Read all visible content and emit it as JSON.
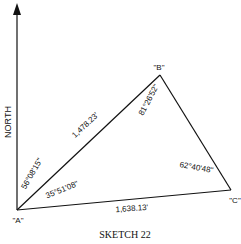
{
  "diagram": {
    "caption": "SKETCH 22",
    "north_label": "NORTH",
    "points": {
      "A": {
        "label": "\"A\"",
        "x": 17,
        "y": 210
      },
      "B": {
        "label": "\"B\"",
        "x": 160,
        "y": 75
      },
      "C": {
        "label": "\"C\"",
        "x": 231,
        "y": 190
      }
    },
    "distances": {
      "AB": "1,478.23'",
      "AC": "1,638.13'"
    },
    "angles": {
      "north_to_AB": "56°08'15\"",
      "at_A": "35°51'08\"",
      "at_B": "81°26'52\"",
      "at_C": "62°40'48\""
    },
    "colors": {
      "line": "#111111",
      "background": "#ffffff"
    }
  }
}
